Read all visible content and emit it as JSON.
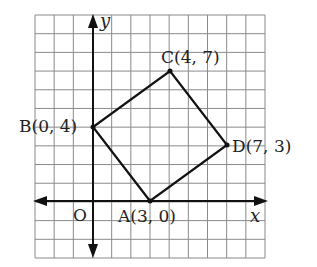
{
  "diagram": {
    "type": "coordinate-grid",
    "grid": {
      "x_min": -3,
      "x_max": 9,
      "y_min": -3,
      "y_max": 10,
      "color": "#888888"
    },
    "axes": {
      "x_label": "x",
      "y_label": "y",
      "origin_label": "O"
    },
    "points": [
      {
        "name": "A",
        "x": 3,
        "y": 0,
        "label": "A(3, 0)"
      },
      {
        "name": "B",
        "x": 0,
        "y": 4,
        "label": "B(0, 4)"
      },
      {
        "name": "C",
        "x": 4,
        "y": 7,
        "label": "C(4, 7)"
      },
      {
        "name": "D",
        "x": 7,
        "y": 3,
        "label": "D(7, 3)"
      }
    ],
    "polygon": [
      "A",
      "B",
      "C",
      "D"
    ],
    "line_color": "#111111"
  }
}
